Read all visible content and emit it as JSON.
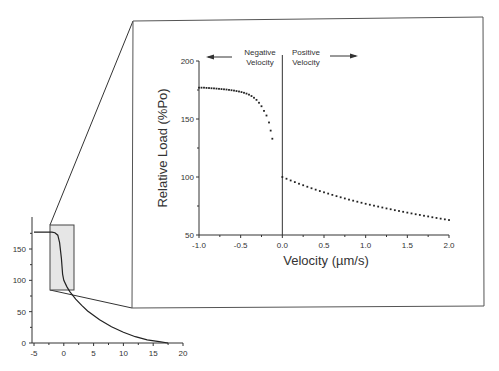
{
  "chart_data": [
    {
      "id": "main",
      "type": "scatter",
      "title": "",
      "xlabel": "Velocity (µm/s)",
      "ylabel": "Relative Load (%Po)",
      "xlim": [
        -1.0,
        2.0
      ],
      "ylim": [
        50,
        200
      ],
      "x_ticks": [
        "-1.0",
        "-0.5",
        "0.0",
        "0.5",
        "1.0",
        "1.5",
        "2.0"
      ],
      "y_ticks": [
        "50",
        "100",
        "150",
        "200"
      ],
      "grid": false,
      "annotations": {
        "negative": "Negative\nVelocity",
        "positive": "Positive\nVelocity",
        "negative_line1": "Negative",
        "negative_line2": "Velocity",
        "positive_line1": "Positive",
        "positive_line2": "Velocity"
      },
      "series": [
        {
          "name": "Negative velocity",
          "x": [
            -1.0,
            -0.97,
            -0.94,
            -0.91,
            -0.88,
            -0.85,
            -0.82,
            -0.79,
            -0.76,
            -0.73,
            -0.7,
            -0.67,
            -0.64,
            -0.61,
            -0.58,
            -0.55,
            -0.52,
            -0.49,
            -0.46,
            -0.43,
            -0.4,
            -0.37,
            -0.34,
            -0.31,
            -0.28,
            -0.25,
            -0.22,
            -0.19,
            -0.16,
            -0.14,
            -0.12
          ],
          "y": [
            177,
            177,
            177,
            176.8,
            176.7,
            176.5,
            176.4,
            176.2,
            176,
            175.8,
            175.6,
            175.4,
            175.1,
            174.8,
            174.5,
            174.1,
            173.7,
            173.2,
            172.6,
            171.9,
            171,
            169.8,
            168.3,
            166.5,
            164,
            161,
            157,
            153,
            147,
            140,
            133
          ]
        },
        {
          "name": "Positive velocity",
          "x": [
            0.0,
            0.05,
            0.1,
            0.15,
            0.2,
            0.25,
            0.3,
            0.35,
            0.4,
            0.45,
            0.5,
            0.55,
            0.6,
            0.65,
            0.7,
            0.75,
            0.8,
            0.85,
            0.9,
            0.95,
            1.0,
            1.05,
            1.1,
            1.15,
            1.2,
            1.25,
            1.3,
            1.35,
            1.4,
            1.45,
            1.5,
            1.55,
            1.6,
            1.65,
            1.7,
            1.75,
            1.8,
            1.85,
            1.9,
            1.95,
            2.0
          ],
          "y": [
            100,
            98.5,
            97,
            95.6,
            94.2,
            92.9,
            91.6,
            90.3,
            89.1,
            87.9,
            86.8,
            85.7,
            84.6,
            83.5,
            82.5,
            81.5,
            80.5,
            79.6,
            78.7,
            77.8,
            76.9,
            76.1,
            75.3,
            74.5,
            73.7,
            72.9,
            72.2,
            71.4,
            70.7,
            70,
            69.3,
            68.6,
            67.9,
            67.3,
            66.6,
            66,
            65.3,
            64.7,
            64.1,
            63.5,
            62.9
          ]
        }
      ]
    },
    {
      "id": "inset",
      "type": "line",
      "title": "",
      "xlabel": "",
      "ylabel": "",
      "xlim": [
        -5,
        20
      ],
      "ylim": [
        0,
        190
      ],
      "x_ticks": [
        "-5",
        "0",
        "5",
        "10",
        "15",
        "20"
      ],
      "y_ticks": [
        "0",
        "50",
        "100",
        "150"
      ],
      "grid": false,
      "highlight_region": {
        "x": [
          -2,
          2
        ],
        "y": [
          85,
          185
        ]
      },
      "series": [
        {
          "name": "Load-velocity curve",
          "x": [
            -5,
            -2,
            -1.5,
            -1,
            -0.7,
            -0.4,
            -0.2,
            0,
            0.5,
            1,
            2,
            3,
            4,
            6,
            8,
            10,
            12,
            14,
            16,
            17.5
          ],
          "y": [
            177,
            177,
            176,
            172,
            160,
            135,
            110,
            100,
            90,
            82,
            70,
            60,
            51,
            37,
            26,
            17,
            10,
            5,
            2,
            0
          ]
        }
      ]
    }
  ]
}
